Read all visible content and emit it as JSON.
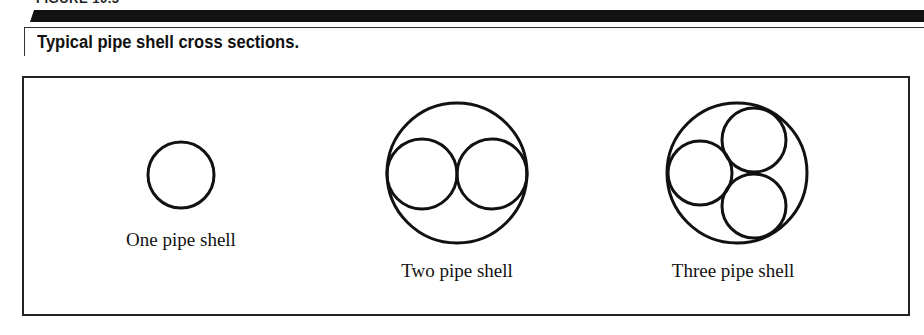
{
  "figure": {
    "label": "FIGURE 10.3",
    "caption": "Typical pipe shell cross sections."
  },
  "diagrams": [
    {
      "name": "one-pipe-shell",
      "label": "One pipe shell",
      "outer": {
        "cx": 181,
        "cy": 175,
        "r": 33
      },
      "inner": []
    },
    {
      "name": "two-pipe-shell",
      "label": "Two pipe shell",
      "outer": {
        "cx": 457,
        "cy": 173,
        "r": 70
      },
      "inner": [
        {
          "cx": 422,
          "cy": 174,
          "r": 35
        },
        {
          "cx": 492,
          "cy": 174,
          "r": 35
        }
      ]
    },
    {
      "name": "three-pipe-shell",
      "label": "Three pipe shell",
      "outer": {
        "cx": 737,
        "cy": 173,
        "r": 70
      },
      "inner": [
        {
          "cx": 700,
          "cy": 173,
          "r": 32
        },
        {
          "cx": 754,
          "cy": 140,
          "r": 32
        },
        {
          "cx": 754,
          "cy": 206,
          "r": 32
        }
      ]
    }
  ],
  "labels": {
    "one": "One pipe shell",
    "two": "Two pipe shell",
    "three": "Three pipe shell"
  },
  "colors": {
    "stroke": "#111111",
    "background": "#ffffff"
  }
}
